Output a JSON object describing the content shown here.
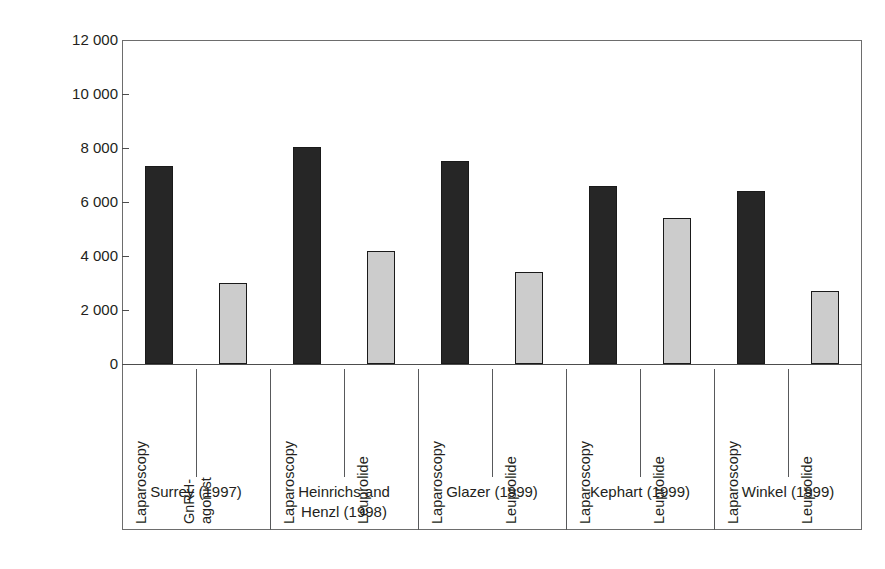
{
  "chart_data": {
    "type": "bar",
    "title": "",
    "xlabel": "",
    "ylabel": "Cost per patient (US$)",
    "ylim": [
      0,
      12000
    ],
    "ytick_values": [
      12000,
      10000,
      8000,
      6000,
      4000,
      2000,
      0
    ],
    "ytick_labels": [
      "12 000",
      "10 000",
      "8 000",
      "6 000",
      "4 000",
      "2 000",
      "0"
    ],
    "grid": false,
    "legend": "none",
    "categories": [
      "Laparoscopy",
      "GnRH-agonist",
      "Laparoscopy",
      "Leuprolide",
      "Laparoscopy",
      "Leuprolide",
      "Laparoscopy",
      "Leuprolide",
      "Laparoscopy",
      "Leuprolide"
    ],
    "values": [
      7350,
      3000,
      8050,
      4200,
      7500,
      3400,
      6600,
      5400,
      6400,
      2700
    ],
    "bar_styles": [
      "dark",
      "light",
      "dark",
      "light",
      "dark",
      "light",
      "dark",
      "light",
      "dark",
      "light"
    ],
    "groups": [
      {
        "label": "Surrey (1997)",
        "label_lines": [
          "Surrey (1997)"
        ],
        "bars": 2
      },
      {
        "label": "Heinrichs and Henzl (1998)",
        "label_lines": [
          "Heinrichs and",
          "Henzl (1998)"
        ],
        "bars": 2
      },
      {
        "label": "Glazer (1999)",
        "label_lines": [
          "Glazer (1999)"
        ],
        "bars": 2
      },
      {
        "label": "Kephart (1999)",
        "label_lines": [
          "Kephart (1999)"
        ],
        "bars": 2
      },
      {
        "label": "Winkel (1999)",
        "label_lines": [
          "Winkel (1999)"
        ],
        "bars": 2
      }
    ],
    "category_label_lines": [
      [
        "Laparoscopy"
      ],
      [
        "GnRH-",
        "agonist"
      ],
      [
        "Laparoscopy"
      ],
      [
        "Leuprolide"
      ],
      [
        "Laparoscopy"
      ],
      [
        "Leuprolide"
      ],
      [
        "Laparoscopy"
      ],
      [
        "Leuprolide"
      ],
      [
        "Laparoscopy"
      ],
      [
        "Leuprolide"
      ]
    ],
    "colors": {
      "dark_bar": "#262626",
      "light_bar": "#cccccc",
      "bar_outline": "#1a1a1a",
      "axis": "#4d4d4d",
      "frame": "#6d6d6d",
      "text": "#231f20",
      "background": "#ffffff"
    }
  }
}
